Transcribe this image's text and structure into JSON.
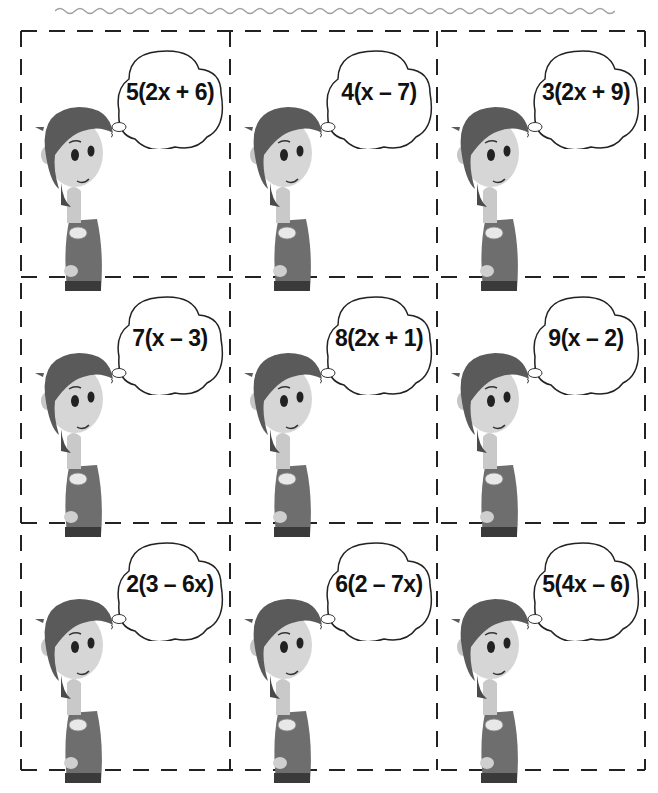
{
  "worksheet": {
    "decoration": "wavy-divider",
    "layout": {
      "rows": 3,
      "columns": 3,
      "border_style": "dashed cut lines"
    },
    "cards": [
      {
        "expression": "5(2x + 6)"
      },
      {
        "expression": "4(x – 7)"
      },
      {
        "expression": "3(2x + 9)"
      },
      {
        "expression": "7(x – 3)"
      },
      {
        "expression": "8(2x + 1)"
      },
      {
        "expression": "9(x – 2)"
      },
      {
        "expression": "2(3 – 6x)"
      },
      {
        "expression": "6(2 – 7x)"
      },
      {
        "expression": "5(4x – 6)"
      }
    ]
  },
  "colors": {
    "line": "#222222",
    "wavy": "#9a9a9a",
    "hair": "#5a5a5a",
    "skin": "#d8d8d8",
    "sweater": "#6e6e6e",
    "pants": "#3a3a3a"
  }
}
